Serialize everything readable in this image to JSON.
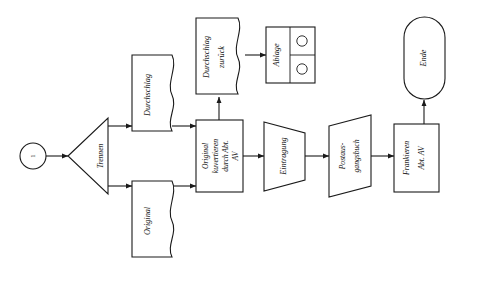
{
  "diagram": {
    "orientation": "rotated-90-ccw",
    "language": "de",
    "stroke_color": "#1a1a1a",
    "background_color": "#ffffff"
  },
  "nodes": {
    "start": {
      "label": "1",
      "shape": "circle",
      "type": "connector-start"
    },
    "trennen": {
      "label": "Trennen",
      "shape": "triangle",
      "type": "split"
    },
    "durchschlag": {
      "label": "Durchschlag",
      "shape": "document",
      "type": "document"
    },
    "original": {
      "label": "Original",
      "shape": "document",
      "type": "document"
    },
    "kuvertieren": {
      "line1": "Original",
      "line2": "kuvertieren",
      "line3": "durch Abt.",
      "line4": "AV",
      "shape": "rectangle",
      "type": "process"
    },
    "durchschlag_zurueck": {
      "line1": "Durchschlag",
      "line2": "zurück",
      "shape": "document",
      "type": "document"
    },
    "ablage": {
      "label": "Ablage",
      "shape": "rectangle-split",
      "type": "storage",
      "marks": [
        "circle",
        "circle"
      ]
    },
    "eintragung": {
      "label": "Eintragung",
      "shape": "trapezoid",
      "type": "manual-operation"
    },
    "postausgangsbuch": {
      "line1": "Postaus-",
      "line2": "gangsbuch",
      "shape": "parallelogram",
      "type": "data"
    },
    "frankieren": {
      "line1": "Frankieren",
      "line2": "Abt. AV",
      "shape": "rectangle",
      "type": "process"
    },
    "ende": {
      "label": "Ende",
      "shape": "stadium",
      "type": "terminator"
    }
  },
  "edges": [
    {
      "from": "start",
      "to": "trennen"
    },
    {
      "from": "trennen",
      "to": "durchschlag"
    },
    {
      "from": "trennen",
      "to": "original"
    },
    {
      "from": "durchschlag",
      "to": "kuvertieren"
    },
    {
      "from": "original",
      "to": "kuvertieren"
    },
    {
      "from": "kuvertieren",
      "to": "durchschlag_zurueck"
    },
    {
      "from": "durchschlag_zurueck",
      "to": "ablage"
    },
    {
      "from": "kuvertieren",
      "to": "eintragung"
    },
    {
      "from": "eintragung",
      "to": "postausgangsbuch"
    },
    {
      "from": "postausgangsbuch",
      "to": "frankieren"
    },
    {
      "from": "frankieren",
      "to": "ende"
    }
  ]
}
